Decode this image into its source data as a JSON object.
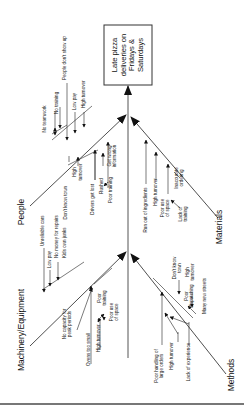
{
  "effect": {
    "lines": [
      "Late pizza",
      "deliveries on",
      "Fridays &",
      "Saturdays"
    ]
  },
  "categories": {
    "people": {
      "label": "People",
      "causes": [
        "No teamwork",
        "No training",
        "People don't show up",
        "Low pay",
        "High turnover",
        "Don't know town",
        "High turnover",
        "Drivers get lost",
        "Rushed",
        "Poor training",
        "Get wrong information"
      ]
    },
    "materials": {
      "label": "Materials",
      "causes": [
        "Run out of ingredients",
        "High turnover",
        "Poor use of space",
        "Inaccurate ordering",
        "Lack of training"
      ]
    },
    "machinery": {
      "label": "Machinery/Equipment",
      "causes": [
        "Unreliable cars",
        "Low pay",
        "No money for repairs",
        "Kids own junks",
        "No capacity for peak periods",
        "Ovens too small",
        "High turnover",
        "Poor training",
        "Poor use of space"
      ]
    },
    "methods": {
      "label": "Methods",
      "causes": [
        "Poor handling of large orders",
        "High turnover",
        "Lack of experience",
        "Don't know town",
        "High turnover",
        "Poor dispatching",
        "Many new streets"
      ]
    }
  },
  "text": {
    "people_cat": "People",
    "materials_cat": "Materials",
    "machinery_cat": "Machinery/Equipment",
    "methods_cat": "Methods",
    "eff1": "Late pizza",
    "eff2": "deliveries on",
    "eff3": "Fridays &",
    "eff4": "Saturdays",
    "p_noteam": "No teamwork",
    "p_notrain": "No training",
    "p_noshow": "People don't show up",
    "p_lowpay": "Low pay",
    "p_hiturn": "High turnover",
    "p_dkt": "Don't know town",
    "p_high": "High",
    "p_turnover": "turnover",
    "p_lost": "Drivers get lost",
    "p_rushed": "Rushed",
    "p_poortrain": "Poor training",
    "p_getwrong": "Get wrong",
    "p_info": "information",
    "m_runout": "Run out of ingredients",
    "m_hiturn": "High turnover",
    "m_pooruse": "Poor use",
    "m_ofspace": "of space",
    "m_inacc": "Inaccurate",
    "m_ordering": "ordering",
    "m_lackof": "Lack of",
    "m_training": "training",
    "e_unrel": "Unreliable cars",
    "e_lowpay": "Low pay",
    "e_nomoney": "No money for repairs",
    "e_kids": "Kids own junks",
    "e_nocap": "No capacity for",
    "e_peak": "peak periods",
    "e_ovens": "Ovens too small",
    "e_hiturn": "High turnover",
    "e_poor": "Poor",
    "e_training": "training",
    "e_pooruse": "Poor use",
    "e_ofspace": "of space",
    "t_poorhand": "Poor handling of",
    "t_large": "large orders",
    "t_hiturn": "High turnover",
    "t_lack": "Lack of experience",
    "t_dkt1": "Don't know",
    "t_dkt2": "town",
    "t_high": "High",
    "t_turnover": "turnover",
    "t_poor": "Poor",
    "t_dispatch": "dispatching",
    "t_streets": "Many new streets"
  }
}
